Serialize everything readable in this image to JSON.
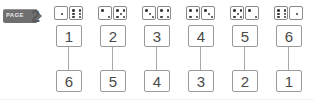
{
  "badge": {
    "label": "PAGE",
    "number": "2",
    "icon": "ribbon-tag-icon",
    "color": "#6f6f6f"
  },
  "worksheet": {
    "title": "Number bonds to 7 with dice",
    "columns": [
      {
        "dice": {
          "left_value": 1,
          "right_value": 6
        },
        "top_box": "1",
        "bottom_box": "6"
      },
      {
        "dice": {
          "left_value": 2,
          "right_value": 5
        },
        "top_box": "2",
        "bottom_box": "5"
      },
      {
        "dice": {
          "left_value": 3,
          "right_value": 4
        },
        "top_box": "3",
        "bottom_box": "4"
      },
      {
        "dice": {
          "left_value": 4,
          "right_value": 3
        },
        "top_box": "4",
        "bottom_box": "3"
      },
      {
        "dice": {
          "left_value": 5,
          "right_value": 2
        },
        "top_box": "5",
        "bottom_box": "2"
      },
      {
        "dice": {
          "left_value": 6,
          "right_value": 1
        },
        "top_box": "6",
        "bottom_box": "1"
      }
    ]
  },
  "colors": {
    "background": "#ffffff",
    "box_border": "#9a9a9a",
    "die_border": "#8a8a8a",
    "pip": "#3a3a3a",
    "text": "#4a4a4a",
    "connector": "#a8a8a8"
  }
}
